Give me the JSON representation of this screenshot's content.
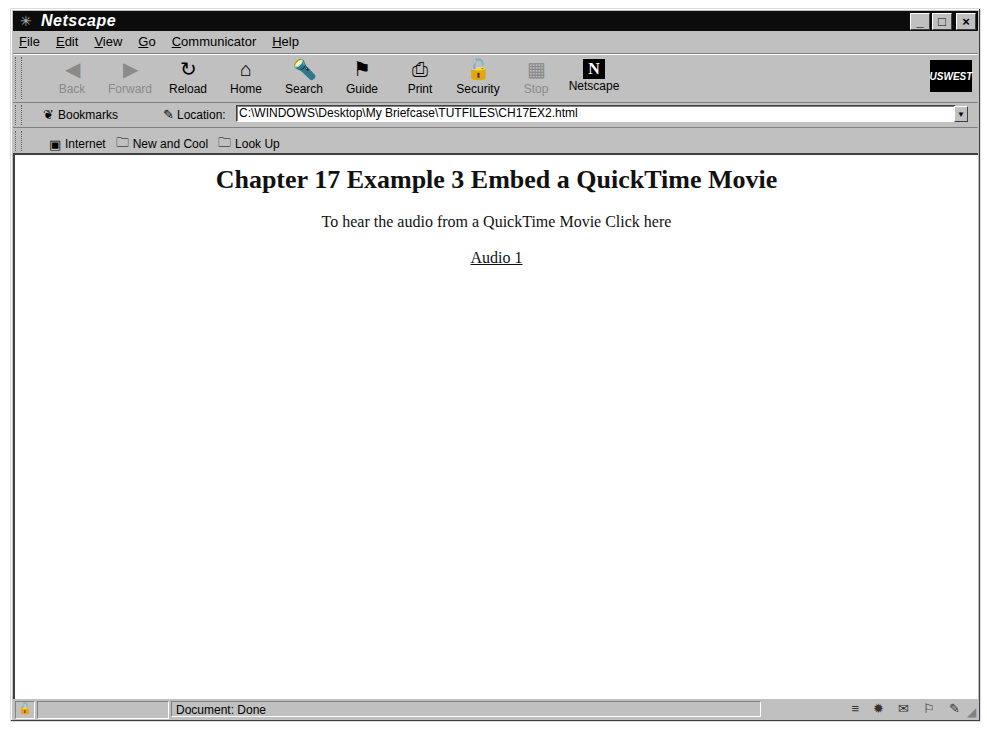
{
  "window": {
    "title": "Netscape",
    "icon": "netscape-app-icon",
    "controls": {
      "minimize": "_",
      "maximize": "□",
      "close": "×"
    }
  },
  "menu": {
    "items": [
      "File",
      "Edit",
      "View",
      "Go",
      "Communicator",
      "Help"
    ]
  },
  "navigation_toolbar": {
    "buttons": [
      {
        "label": "Back",
        "icon": "back-arrow-icon",
        "glyph": "◀",
        "enabled": false
      },
      {
        "label": "Forward",
        "icon": "forward-arrow-icon",
        "glyph": "▶",
        "enabled": false
      },
      {
        "label": "Reload",
        "icon": "reload-icon",
        "glyph": "↻",
        "enabled": true
      },
      {
        "label": "Home",
        "icon": "home-icon",
        "glyph": "⌂",
        "enabled": true
      },
      {
        "label": "Search",
        "icon": "search-icon",
        "glyph": "🔦",
        "enabled": true
      },
      {
        "label": "Guide",
        "icon": "guide-icon",
        "glyph": "⚑",
        "enabled": true
      },
      {
        "label": "Print",
        "icon": "print-icon",
        "glyph": "⎙",
        "enabled": true
      },
      {
        "label": "Security",
        "icon": "security-lock-icon",
        "glyph": "🔓",
        "enabled": true
      },
      {
        "label": "Stop",
        "icon": "stop-icon",
        "glyph": "▦",
        "enabled": false
      },
      {
        "label": "Netscape",
        "icon": "netscape-n-icon",
        "glyph": "N",
        "enabled": true
      }
    ],
    "brand_logo": "USWEST"
  },
  "location_toolbar": {
    "bookmarks_label": "Bookmarks",
    "location_label": "Location:",
    "url": "C:\\WINDOWS\\Desktop\\My Briefcase\\TUTFILES\\CH17EX2.html"
  },
  "personal_toolbar": {
    "items": [
      "Internet",
      "New and Cool",
      "Look Up"
    ]
  },
  "page": {
    "heading": "Chapter 17 Example 3 Embed a QuickTime Movie",
    "intro": "To hear the audio from a QuickTime Movie Click here",
    "link": "Audio 1"
  },
  "status": {
    "text": "Document: Done"
  }
}
